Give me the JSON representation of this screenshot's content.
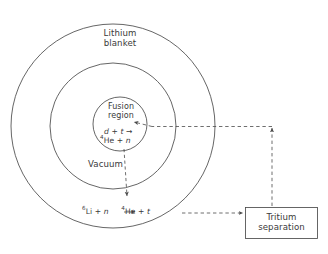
{
  "figure": {
    "type": "schematic-diagram",
    "background_color": "#ffffff",
    "line_color": "#4a4a4a",
    "text_color": "#3a3a3a"
  },
  "regions": {
    "outer_label_line1": "Lithium",
    "outer_label_line2": "blanket",
    "middle_label": "Vacuum",
    "inner_label_line1": "Fusion",
    "inner_label_line2": "region"
  },
  "equations": {
    "fusion_reactants": "d",
    "fusion_plus1": "+",
    "fusion_reactant2": "t",
    "fusion_product_mass": "4",
    "fusion_product": "He",
    "fusion_plus2": "+",
    "fusion_neutron": "n",
    "breeding_mass": "6",
    "breeding_element": "Li",
    "breeding_plus1": "+",
    "breeding_neutron": "n",
    "breeding_product_mass": "4",
    "breeding_product": "He",
    "breeding_plus2": "+",
    "breeding_tritium": "t"
  },
  "process_box": {
    "line1": "Tritium",
    "line2": "separation"
  }
}
